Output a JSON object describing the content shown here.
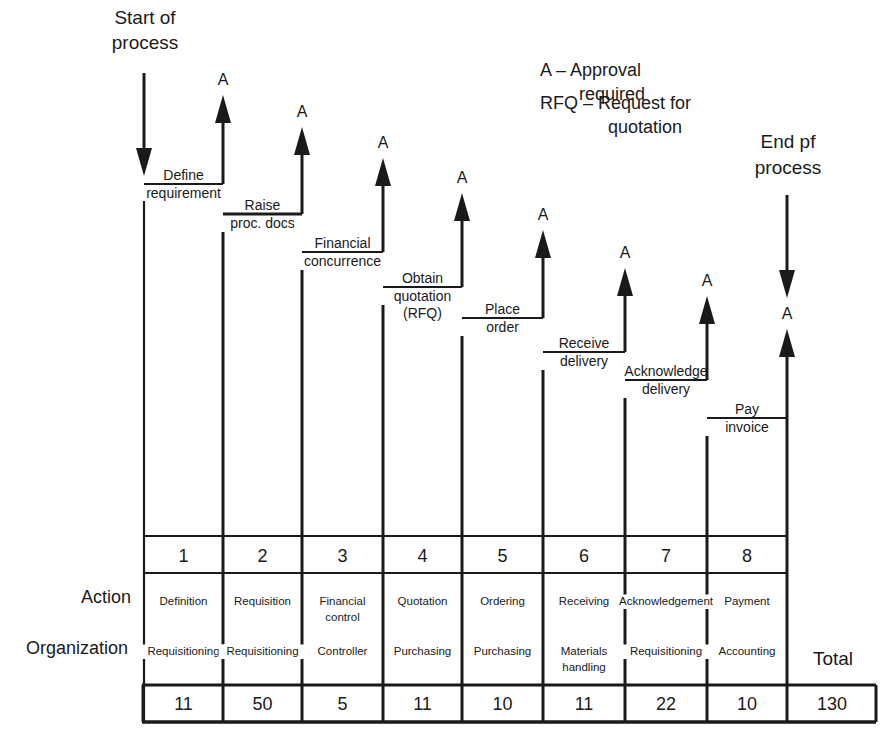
{
  "header": {
    "start_label": [
      "Start of",
      "process"
    ],
    "end_label": [
      "End pf",
      "process"
    ]
  },
  "legend": {
    "approval": [
      "A – Approval",
      "required"
    ],
    "rfq": [
      "RFQ – Request for",
      "quotation"
    ]
  },
  "approval_marker": "A",
  "steps": [
    {
      "number": "1",
      "step_label": [
        "Define",
        "requirement"
      ],
      "action": [
        "Definition"
      ],
      "organization": [
        "Requisitioning"
      ],
      "time": "11"
    },
    {
      "number": "2",
      "step_label": [
        "Raise",
        "proc. docs"
      ],
      "action": [
        "Requisition"
      ],
      "organization": [
        "Requisitioning"
      ],
      "time": "50"
    },
    {
      "number": "3",
      "step_label": [
        "Financial",
        "concurrence"
      ],
      "action": [
        "Financial",
        "control"
      ],
      "organization": [
        "Controller"
      ],
      "time": "5"
    },
    {
      "number": "4",
      "step_label": [
        "Obtain",
        "quotation",
        "(RFQ)"
      ],
      "action": [
        "Quotation"
      ],
      "organization": [
        "Purchasing"
      ],
      "time": "11"
    },
    {
      "number": "5",
      "step_label": [
        "Place",
        "order"
      ],
      "action": [
        "Ordering"
      ],
      "organization": [
        "Purchasing"
      ],
      "time": "10"
    },
    {
      "number": "6",
      "step_label": [
        "Receive",
        "delivery"
      ],
      "action": [
        "Receiving"
      ],
      "organization": [
        "Materials",
        "handling"
      ],
      "time": "11"
    },
    {
      "number": "7",
      "step_label": [
        "Acknowledge",
        "delivery"
      ],
      "action": [
        "Acknowledgement"
      ],
      "organization": [
        "Requisitioning"
      ],
      "time": "22"
    },
    {
      "number": "8",
      "step_label": [
        "Pay",
        "invoice"
      ],
      "action": [
        "Payment"
      ],
      "organization": [
        "Accounting"
      ],
      "time": "10"
    }
  ],
  "row_labels": {
    "action": "Action",
    "organization": "Organization",
    "total": "Total"
  },
  "total_value": "130",
  "colors": {
    "ink": "#1a1a1a",
    "background": "#ffffff"
  }
}
